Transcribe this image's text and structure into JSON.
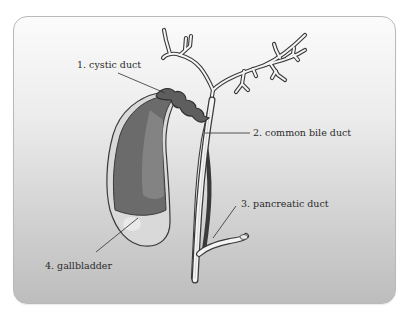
{
  "diagram": {
    "labels": {
      "cystic_duct": "1. cystic duct",
      "common_bile_duct": "2. common bile duct",
      "pancreatic_duct": "3. pancreatic duct",
      "gallbladder": "4. gallbladder"
    },
    "colors": {
      "bile": "#6e6e6e",
      "bile_light": "#8c8c8c",
      "duct_fill": "#f4f4f4",
      "outline": "#3a3a3a",
      "gallbladder_lower": "#dcdcdc"
    }
  }
}
